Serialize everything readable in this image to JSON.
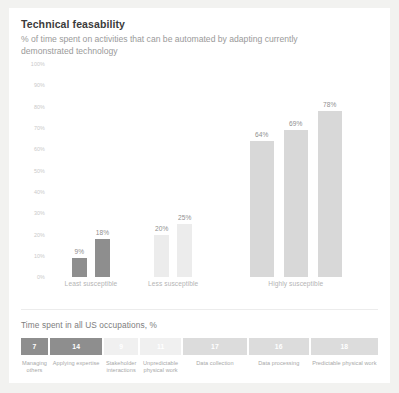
{
  "header": {
    "title": "Technical feasability",
    "subtitle": "% of time spent on activities that can be automated by adapting currently demonstrated technology"
  },
  "bottom": {
    "title": "Time spent in all US occupations, %"
  },
  "colors": {
    "card_background": "#ffffff",
    "page_background": "#f2f2f0",
    "bar_dark": "#8e8e8e",
    "bar_light": "#e8e8e8",
    "bar_mid": "#d8d8d8",
    "title_text": "#3b3b3b",
    "subtitle_text": "#9a9a9a",
    "axis_text": "#c9c9c9",
    "divider": "#ececec"
  },
  "chart_data": {
    "type": "bar",
    "title": "Technical feasability",
    "subtitle": "% of time spent on activities that can be automated by adapting currently demonstrated technology",
    "xlabel": "",
    "ylabel": "",
    "ylim": [
      0,
      100
    ],
    "grid": false,
    "legend": "none",
    "yticks": [
      "100%",
      "90%",
      "80%",
      "70%",
      "60%",
      "50%",
      "40%",
      "30%",
      "20%",
      "10%",
      "0%"
    ],
    "ytick_values": [
      100,
      90,
      80,
      70,
      60,
      50,
      40,
      30,
      20,
      10,
      0
    ],
    "groups": [
      {
        "label": "Least susceptible",
        "bars": [
          {
            "label": "9%",
            "value": 9,
            "color": "#8e8e8e"
          },
          {
            "label": "18%",
            "value": 18,
            "color": "#8e8e8e"
          }
        ]
      },
      {
        "label": "Less susceptible",
        "bars": [
          {
            "label": "20%",
            "value": 20,
            "color": "#ececec"
          },
          {
            "label": "25%",
            "value": 25,
            "color": "#ececec"
          }
        ]
      },
      {
        "label": "Highly susceptible",
        "bars": [
          {
            "label": "64%",
            "value": 64,
            "color": "#d8d8d8"
          },
          {
            "label": "69%",
            "value": 69,
            "color": "#d8d8d8"
          },
          {
            "label": "78%",
            "value": 78,
            "color": "#d8d8d8"
          }
        ]
      }
    ],
    "time_spent_strip": {
      "title": "Time spent in all US occupations, %",
      "segments": [
        {
          "value": "7",
          "number": 7,
          "label": "Managing others",
          "color": "#8e8e8e"
        },
        {
          "value": "14",
          "number": 14,
          "label": "Applying expertise",
          "color": "#8e8e8e"
        },
        {
          "value": "9",
          "number": 9,
          "label": "Stakeholder interactions",
          "color": "#f0f0f0"
        },
        {
          "value": "11",
          "number": 11,
          "label": "Unpredictable physical work",
          "color": "#f0f0f0"
        },
        {
          "value": "17",
          "number": 17,
          "label": "Data collection",
          "color": "#dcdcdc"
        },
        {
          "value": "16",
          "number": 16,
          "label": "Data processing",
          "color": "#dcdcdc"
        },
        {
          "value": "18",
          "number": 18,
          "label": "Predictable physical work",
          "color": "#dcdcdc"
        }
      ]
    }
  }
}
